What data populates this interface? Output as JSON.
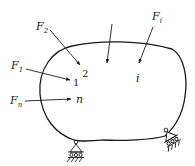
{
  "diagram": {
    "type": "elastic-body-with-point-loads",
    "colors": {
      "stroke": "#1a1a1a",
      "background": "#ffffff"
    },
    "forces": [
      {
        "id": "F1",
        "label": "F",
        "subscript": "1",
        "point": "1"
      },
      {
        "id": "F2",
        "label": "F",
        "subscript": "2",
        "point": "2"
      },
      {
        "id": "Fi",
        "label": "F",
        "subscript": "i",
        "point": "i"
      },
      {
        "id": "Fn",
        "label": "F",
        "subscript": "n",
        "point": "n"
      },
      {
        "id": "unlabeled",
        "label": "",
        "subscript": "",
        "point": ""
      }
    ],
    "points": [
      "1",
      "2",
      "i",
      "n"
    ],
    "supports": [
      {
        "id": "support-left",
        "type": "roller-pin"
      },
      {
        "id": "support-right",
        "type": "roller-pin"
      }
    ]
  }
}
